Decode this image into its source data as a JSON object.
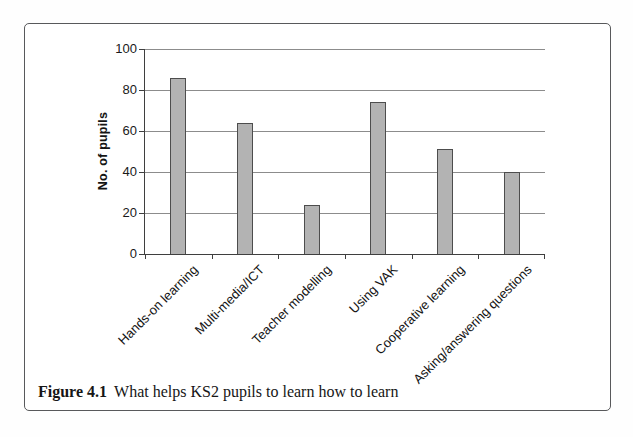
{
  "figure": {
    "caption_label": "Figure 4.1",
    "caption_text": "What helps KS2 pupils to learn how to learn"
  },
  "chart_data": {
    "type": "bar",
    "title": "",
    "xlabel": "",
    "ylabel": "No. of pupils",
    "categories": [
      "Hands-on learning",
      "Multi-media/ICT",
      "Teacher modelling",
      "Using VAK",
      "Cooperative learning",
      "Asking/answering questions"
    ],
    "values": [
      86,
      64,
      24,
      74,
      51,
      40
    ],
    "ylim": [
      0,
      100
    ],
    "yticks": [
      0,
      20,
      40,
      60,
      80,
      100
    ],
    "grid": "horizontal",
    "legend": "none"
  },
  "colors": {
    "bar_fill": "#b3b3b3",
    "bar_border": "#4d4d4d",
    "grid": "#8c8c8c",
    "axis": "#3f3f3f",
    "text": "#1a1a1a",
    "frame_border": "#58595b",
    "background": "#ffffff"
  }
}
